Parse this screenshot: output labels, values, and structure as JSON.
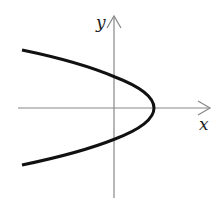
{
  "diagram": {
    "title": "",
    "axes": {
      "x_label": "x",
      "y_label": "y"
    },
    "curve": {
      "type": "parabola opening left",
      "description": "x = a - b*y^2, vertex on positive x-axis"
    },
    "colors": {
      "axis": "#888888",
      "curve": "#111111",
      "background": "#ffffff"
    }
  }
}
